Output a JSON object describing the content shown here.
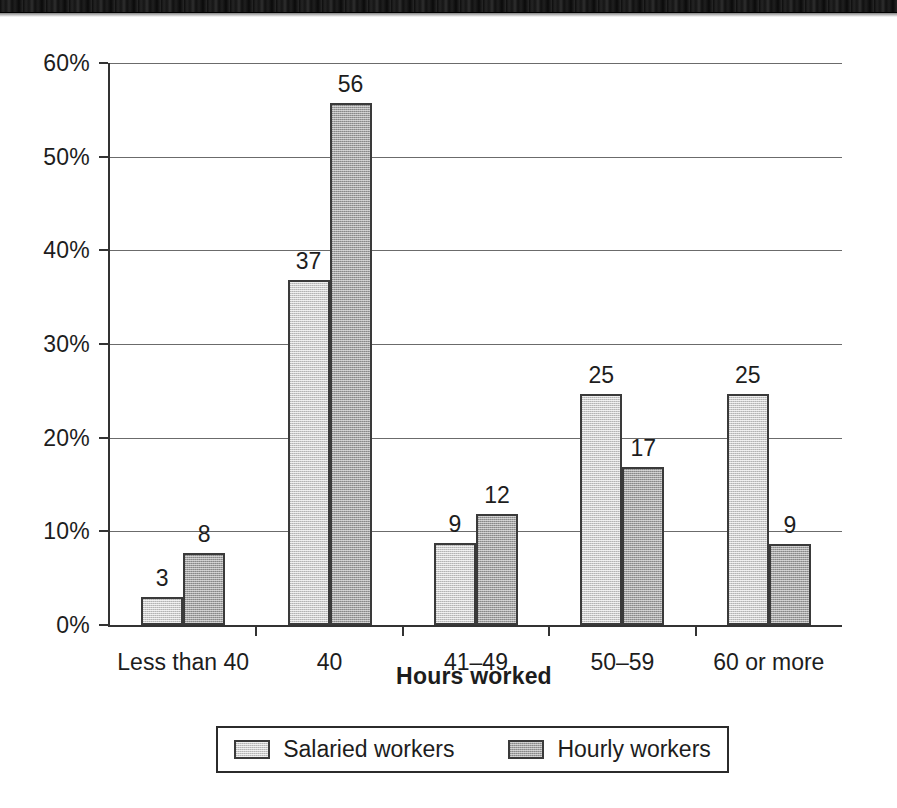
{
  "chart_data": {
    "type": "bar",
    "title": "",
    "xlabel": "Hours worked",
    "ylabel": "",
    "categories": [
      "Less than 40",
      "40",
      "41–49",
      "50–59",
      "60 or more"
    ],
    "series": [
      {
        "name": "Salaried workers",
        "color": "#cbcbcb",
        "values": [
          3,
          37,
          9,
          25,
          25
        ],
        "plotted_percent": [
          3.0,
          36.8,
          8.8,
          24.7,
          24.7
        ]
      },
      {
        "name": "Hourly workers",
        "color": "#a3a3a3",
        "values": [
          8,
          56,
          12,
          17,
          9
        ],
        "plotted_percent": [
          7.7,
          55.7,
          11.8,
          16.9,
          8.7
        ]
      }
    ],
    "ylim": [
      0,
      60
    ],
    "ytick_step": 10,
    "ytick_labels": [
      "0%",
      "10%",
      "20%",
      "30%",
      "40%",
      "50%",
      "60%"
    ],
    "ytick_values": [
      0,
      10,
      20,
      30,
      40,
      50,
      60
    ],
    "grid": true,
    "legend_position": "bottom",
    "value_labels": true
  },
  "legend": {
    "items": [
      {
        "label": "Salaried workers",
        "swatch": "salaried"
      },
      {
        "label": "Hourly workers",
        "swatch": "hourly"
      }
    ]
  }
}
